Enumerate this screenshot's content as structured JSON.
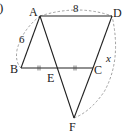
{
  "figure": {
    "problem_mark": ")",
    "points": {
      "A": {
        "label": "A",
        "x": 40,
        "y": 16
      },
      "B": {
        "label": "B",
        "x": 21,
        "y": 68
      },
      "C": {
        "label": "C",
        "x": 93,
        "y": 68
      },
      "D": {
        "label": "D",
        "x": 112,
        "y": 16
      },
      "E": {
        "label": "E",
        "x": 57,
        "y": 68
      },
      "F": {
        "label": "F",
        "x": 74,
        "y": 118
      }
    },
    "lengths": {
      "AD": "8",
      "AB": "6",
      "CF": "x"
    },
    "colors": {
      "line": "#222222",
      "dashed": "#888888"
    }
  }
}
